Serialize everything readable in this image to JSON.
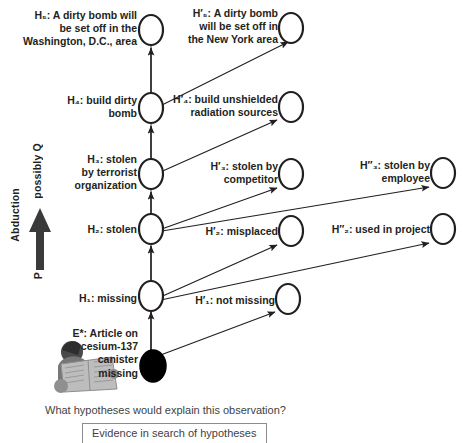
{
  "diagram": {
    "title_caption": "Evidence in search of hypotheses",
    "question": "What hypotheses would explain this observation?",
    "axis": {
      "outer_label": "Abduction",
      "inner_bottom": "P",
      "inner_top": "possibly Q",
      "arrow_icon": "up-arrow-icon"
    },
    "evidence_icon": "person-reading-newspaper-icon",
    "nodes": [
      {
        "id": "H5",
        "prefix": "H",
        "sub": "5",
        "text": "H₅: A dirty bomb will\nbe set off in  the\nWashington, D.C., area",
        "shape": "open-ellipse",
        "column": "main"
      },
      {
        "id": "H5p",
        "prefix": "H'",
        "sub": "5",
        "text": "H′₅: A dirty bomb\nwill be set off in\nthe New York area",
        "shape": "open-ellipse",
        "column": "alt1"
      },
      {
        "id": "H4",
        "prefix": "H",
        "sub": "4",
        "text": "H₄: build dirty\nbomb",
        "shape": "open-ellipse",
        "column": "main"
      },
      {
        "id": "H4p",
        "prefix": "H'",
        "sub": "4",
        "text": "H′₄: build unshielded\nradiation sources",
        "shape": "open-ellipse",
        "column": "alt1"
      },
      {
        "id": "H3",
        "prefix": "H",
        "sub": "3",
        "text": "H₃: stolen\nby terrorist\norganization",
        "shape": "open-ellipse",
        "column": "main"
      },
      {
        "id": "H3p",
        "prefix": "H'",
        "sub": "3",
        "text": "H′₃: stolen by\ncompetitor",
        "shape": "open-ellipse",
        "column": "alt1"
      },
      {
        "id": "H3pp",
        "prefix": "H\"",
        "sub": "3",
        "text": "H″₃: stolen by\nemployee",
        "shape": "open-ellipse",
        "column": "alt2"
      },
      {
        "id": "H2",
        "prefix": "H",
        "sub": "2",
        "text": "H₂: stolen",
        "shape": "open-ellipse",
        "column": "main"
      },
      {
        "id": "H2p",
        "prefix": "H'",
        "sub": "2",
        "text": "H′₂: misplaced",
        "shape": "open-ellipse",
        "column": "alt1"
      },
      {
        "id": "H2pp",
        "prefix": "H\"",
        "sub": "2",
        "text": "H″₂: used in project",
        "shape": "open-ellipse",
        "column": "alt2"
      },
      {
        "id": "H1",
        "prefix": "H",
        "sub": "1",
        "text": "H₁: missing",
        "shape": "open-ellipse",
        "column": "main"
      },
      {
        "id": "H1p",
        "prefix": "H'",
        "sub": "1",
        "text": "H′₁: not missing",
        "shape": "open-ellipse",
        "column": "alt1"
      },
      {
        "id": "Estar",
        "prefix": "E*",
        "sub": "",
        "text": "E*: Article on\ncesium-137\ncanister\nmissing",
        "shape": "filled-ellipse",
        "column": "main"
      }
    ],
    "edges": [
      {
        "from": "Estar",
        "to": "H1"
      },
      {
        "from": "Estar",
        "to": "H1p"
      },
      {
        "from": "H1",
        "to": "H2"
      },
      {
        "from": "H1",
        "to": "H2p"
      },
      {
        "from": "H1",
        "to": "H2pp"
      },
      {
        "from": "H2",
        "to": "H3"
      },
      {
        "from": "H2",
        "to": "H3p"
      },
      {
        "from": "H2",
        "to": "H3pp"
      },
      {
        "from": "H3",
        "to": "H4"
      },
      {
        "from": "H3",
        "to": "H4p"
      },
      {
        "from": "H4",
        "to": "H5"
      },
      {
        "from": "H4",
        "to": "H5p"
      }
    ],
    "colors": {
      "stroke": "#231f20",
      "spine": "#6f6f6f",
      "text": "#231f20",
      "caption_text": "#3f3f3f",
      "caption_border": "#8c8c8c",
      "evidence_fill": "#000000"
    }
  }
}
